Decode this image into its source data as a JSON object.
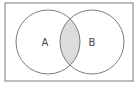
{
  "diagram": {
    "type": "venn",
    "shaded_region": "A ∩ B",
    "universe": {
      "x": 5,
      "y": 3,
      "width": 128,
      "height": 78
    },
    "sets": [
      {
        "label": "A",
        "cx": 48,
        "cy": 42,
        "r": 32
      },
      {
        "label": "B",
        "cx": 92,
        "cy": 42,
        "r": 32
      }
    ],
    "colors": {
      "stroke": "#7a7a7a",
      "shade": "#dcdcdc",
      "background": "#ffffff"
    }
  }
}
